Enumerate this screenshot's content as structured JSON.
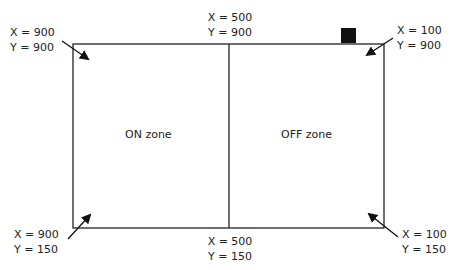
{
  "diagram": {
    "zones": {
      "left": "ON zone",
      "right": "OFF zone"
    },
    "corners": {
      "top_left": {
        "x": "X = 900",
        "y": "Y = 900"
      },
      "top_middle": {
        "x": "X = 500",
        "y": "Y = 900"
      },
      "top_right": {
        "x": "X = 100",
        "y": "Y = 900"
      },
      "bottom_left": {
        "x": "X = 900",
        "y": "Y = 150"
      },
      "bottom_middle": {
        "x": "X = 500",
        "y": "Y = 150"
      },
      "bottom_right": {
        "x": "X = 100",
        "y": "Y = 150"
      }
    },
    "marker": "black-square"
  }
}
